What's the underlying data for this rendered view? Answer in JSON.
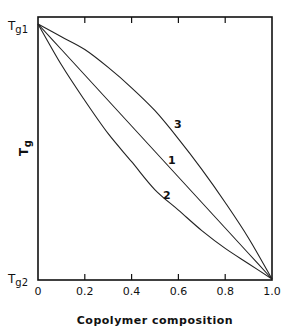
{
  "chart_data": {
    "type": "line",
    "title": "",
    "xlabel": "Copolymer composition",
    "ylabel": "Tg",
    "xlim": [
      0,
      1.0
    ],
    "ylim_labels": {
      "top": "Tg1",
      "bottom": "Tg2"
    },
    "x_ticks": [
      "0",
      "0.2",
      "0.4",
      "0.6",
      "0.8",
      "1.0"
    ],
    "grid": false,
    "legend": "inline curve labels",
    "x": [
      0,
      0.1,
      0.2,
      0.3,
      0.4,
      0.5,
      0.6,
      0.7,
      0.8,
      0.9,
      1.0
    ],
    "series": [
      {
        "name": "1",
        "values": [
          1.0,
          0.9,
          0.8,
          0.7,
          0.6,
          0.5,
          0.4,
          0.3,
          0.2,
          0.1,
          0.0
        ]
      },
      {
        "name": "2",
        "values": [
          1.0,
          0.84,
          0.7,
          0.57,
          0.46,
          0.35,
          0.27,
          0.19,
          0.12,
          0.06,
          0.0
        ]
      },
      {
        "name": "3",
        "values": [
          1.0,
          0.95,
          0.9,
          0.83,
          0.75,
          0.66,
          0.55,
          0.43,
          0.3,
          0.16,
          0.0
        ]
      }
    ]
  },
  "labels": {
    "y_top": "Tg1",
    "y_bottom": "Tg2",
    "y_axis": "Tg",
    "x_axis": "Copolymer composition",
    "curve_1": "1",
    "curve_2": "2",
    "curve_3": "3",
    "ticks": [
      "0",
      "0.2",
      "0.4",
      "0.6",
      "0.8",
      "1.0"
    ]
  }
}
